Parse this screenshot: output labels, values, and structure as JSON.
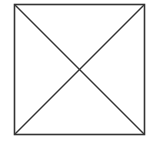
{
  "diagram": {
    "type": "square-with-diagonals",
    "stroke_color": "#333333",
    "background_color": "#ffffff",
    "square": {
      "x": 14.5,
      "y": 4.5,
      "width": 130,
      "height": 130
    },
    "diagonals": [
      {
        "from": [
          14.5,
          4.5
        ],
        "to": [
          144.5,
          134.5
        ]
      },
      {
        "from": [
          144.5,
          4.5
        ],
        "to": [
          14.5,
          134.5
        ]
      }
    ]
  }
}
